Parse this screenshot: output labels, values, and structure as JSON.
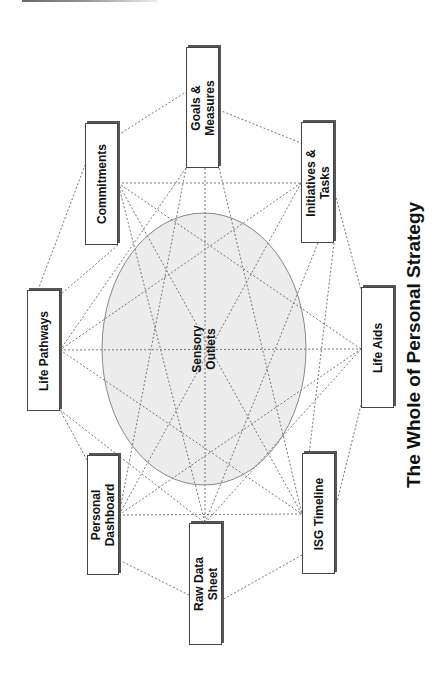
{
  "title": "The Whole of Personal Strategy",
  "center": {
    "line1": "Sensory",
    "line2": "Outlets",
    "fill": "#ececec",
    "stroke": "#888888"
  },
  "nodes": [
    {
      "id": "goals",
      "line1": "Goals &",
      "line2": "Measures"
    },
    {
      "id": "commitments",
      "line1": "Commitments",
      "line2": ""
    },
    {
      "id": "life-pathways",
      "line1": "Life Pathways",
      "line2": ""
    },
    {
      "id": "personal-dashboard",
      "line1": "Personal",
      "line2": "Dashboard"
    },
    {
      "id": "raw-data-sheet",
      "line1": "Raw Data",
      "line2": "Sheet"
    },
    {
      "id": "isg-timeline",
      "line1": "ISG Timeline",
      "line2": ""
    },
    {
      "id": "life-aids",
      "line1": "Life Aids",
      "line2": ""
    },
    {
      "id": "initiatives",
      "line1": "Initiatives &",
      "line2": "Tasks"
    }
  ],
  "line_color": "#777777"
}
